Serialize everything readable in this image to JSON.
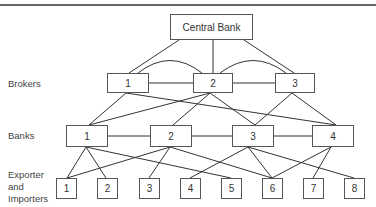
{
  "diagram": {
    "central_bank": {
      "label": "Central Bank"
    },
    "row_labels": {
      "brokers": "Brokers",
      "banks": "Banks",
      "exporters": [
        "Exporter",
        "and",
        "Importers"
      ]
    },
    "brokers": [
      {
        "label": "1"
      },
      {
        "label": "2"
      },
      {
        "label": "3"
      }
    ],
    "banks": [
      {
        "label": "1"
      },
      {
        "label": "2"
      },
      {
        "label": "3"
      },
      {
        "label": "4"
      }
    ],
    "traders": [
      {
        "label": "1"
      },
      {
        "label": "2"
      },
      {
        "label": "3"
      },
      {
        "label": "4"
      },
      {
        "label": "5"
      },
      {
        "label": "6"
      },
      {
        "label": "7"
      },
      {
        "label": "8"
      }
    ],
    "edges": {
      "central_to_brokers": [
        1,
        2,
        3
      ],
      "broker_to_broker": [
        [
          1,
          2
        ],
        [
          2,
          3
        ]
      ],
      "broker_arcs": [
        [
          1,
          2
        ],
        [
          2,
          3
        ]
      ],
      "broker_to_bank": [
        [
          1,
          1
        ],
        [
          1,
          4
        ],
        [
          2,
          1
        ],
        [
          2,
          2
        ],
        [
          2,
          3
        ],
        [
          3,
          3
        ],
        [
          3,
          4
        ]
      ],
      "bank_to_bank": [
        [
          1,
          2
        ],
        [
          2,
          3
        ],
        [
          3,
          4
        ]
      ],
      "bank_to_trader": [
        [
          1,
          1
        ],
        [
          1,
          2
        ],
        [
          1,
          5
        ],
        [
          2,
          1
        ],
        [
          2,
          3
        ],
        [
          2,
          6
        ],
        [
          3,
          4
        ],
        [
          3,
          6
        ],
        [
          3,
          8
        ],
        [
          4,
          6
        ],
        [
          4,
          7
        ]
      ]
    }
  }
}
